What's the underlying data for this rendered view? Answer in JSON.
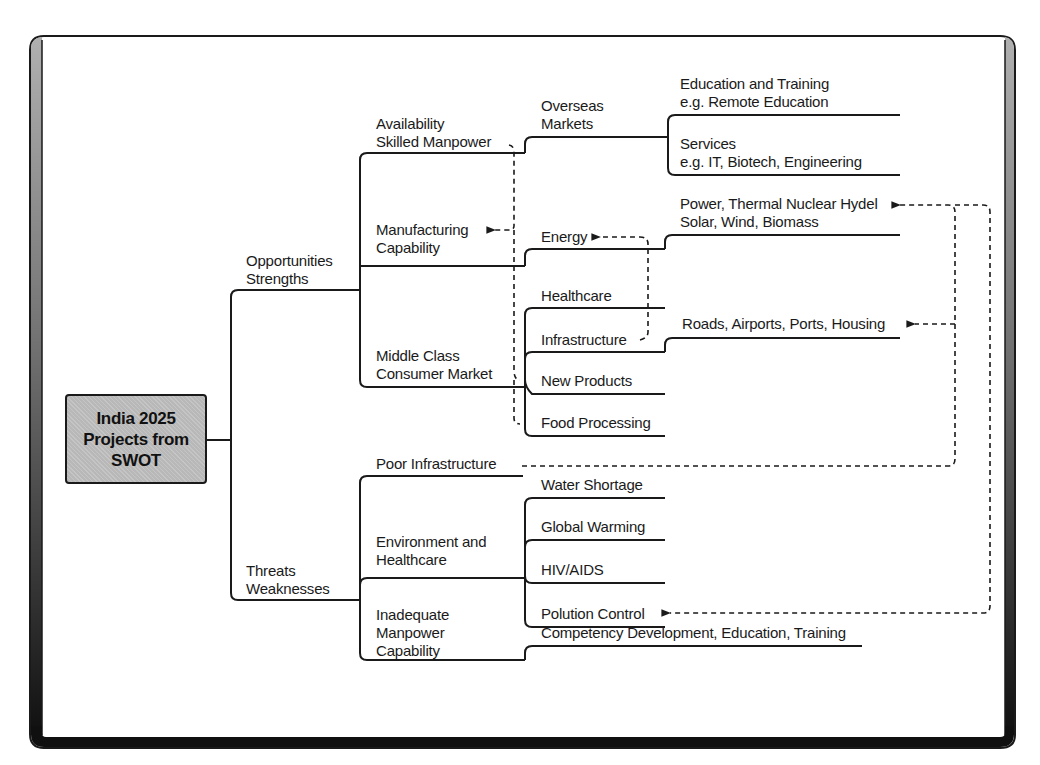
{
  "diagram": {
    "root": {
      "lines": [
        "India 2025",
        "Projects from",
        "SWOT"
      ]
    },
    "branches": {
      "opportunities": [
        "Opportunities",
        "Strengths"
      ],
      "threats": [
        "Threats",
        "Weaknesses"
      ]
    },
    "opportunities": {
      "availability": [
        "Availability",
        "Skilled Manpower"
      ],
      "manufacturing": [
        "Manufacturing",
        "Capability"
      ],
      "middle_class": [
        "Middle Class",
        "Consumer Market"
      ],
      "overseas": [
        "Overseas",
        "Markets"
      ],
      "energy": "Energy",
      "education": [
        "Education and Training",
        "e.g. Remote Education"
      ],
      "services": [
        "Services",
        "e.g. IT, Biotech, Engineering"
      ],
      "power": [
        "Power, Thermal Nuclear Hydel",
        "Solar, Wind, Biomass"
      ],
      "healthcare": "Healthcare",
      "infrastructure": "Infrastructure",
      "new_products": "New Products",
      "food_processing": "Food Processing",
      "roads": "Roads, Airports, Ports, Housing"
    },
    "threats": {
      "poor_infrastructure": "Poor Infrastructure",
      "environment": [
        "Environment and",
        "Healthcare"
      ],
      "inadequate": [
        "Inadequate",
        "Manpower",
        "Capability"
      ],
      "water": "Water Shortage",
      "global_warming": "Global Warming",
      "hiv": "HIV/AIDS",
      "polution": "Polution Control",
      "competency": "Competency Development, Education, Training"
    },
    "colors": {
      "line": "#1a1a1a",
      "root_fill": "#b8b8b8",
      "frame_shade": "#a0a0a0"
    }
  }
}
